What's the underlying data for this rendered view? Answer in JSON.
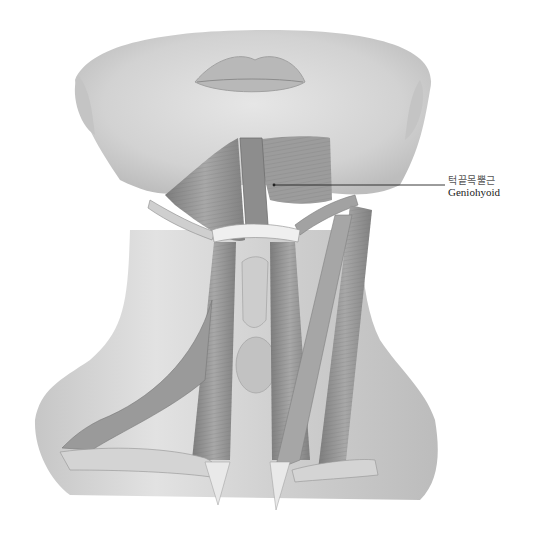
{
  "figure": {
    "labels": [
      {
        "korean": "턱끝목뿔근",
        "english": "Geniohyoid",
        "pointer_from": [
          274,
          185
        ],
        "pointer_to": [
          445,
          185
        ]
      }
    ]
  },
  "colors": {
    "background": "#ffffff",
    "skin": "#dcdcdc",
    "muscle": "#9a9a9a",
    "muscle_dark": "#6f6f6f",
    "tendon": "#ececec",
    "leader_line": "#222222"
  }
}
